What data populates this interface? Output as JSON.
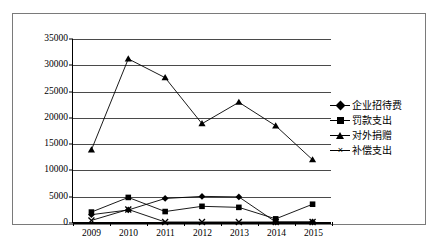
{
  "chart_data": {
    "type": "line",
    "title": "",
    "subtitle": "",
    "xlabel": "",
    "ylabel": "",
    "categories": [
      "2009",
      "2010",
      "2011",
      "2012",
      "2013",
      "2014",
      "2015"
    ],
    "ylim": [
      0,
      35000
    ],
    "ytick_labels": [
      "0",
      "5000",
      "10000",
      "15000",
      "20000",
      "25000",
      "30000",
      "35000"
    ],
    "ytick_values": [
      0,
      5000,
      10000,
      15000,
      20000,
      25000,
      30000,
      35000
    ],
    "grid": true,
    "legend_position": "right",
    "series": [
      {
        "name": "企业招待费",
        "marker": "diamond",
        "values": [
          1400,
          2300,
          4500,
          4900,
          4800,
          0,
          0
        ]
      },
      {
        "name": "罚款支出",
        "marker": "square",
        "values": [
          1900,
          4700,
          2000,
          3000,
          2800,
          600,
          3400
        ]
      },
      {
        "name": "对外捐赠",
        "marker": "triangle",
        "values": [
          13800,
          31200,
          27600,
          18800,
          22900,
          18400,
          11900
        ]
      },
      {
        "name": "补偿支出",
        "marker": "x",
        "values": [
          300,
          2400,
          0,
          0,
          0,
          0,
          0
        ]
      }
    ]
  },
  "legend": {
    "entries": [
      {
        "label": "企业招待费",
        "marker": "diamond"
      },
      {
        "label": "罚款支出",
        "marker": "square"
      },
      {
        "label": "对外捐赠",
        "marker": "triangle"
      },
      {
        "label": "补偿支出",
        "marker": "x"
      }
    ]
  },
  "style": {
    "line_color": "#000000",
    "grid_color": "#4a4a4a",
    "axis_color": "#000000",
    "frame_color": "#7a7a7a",
    "background": "#ffffff"
  }
}
